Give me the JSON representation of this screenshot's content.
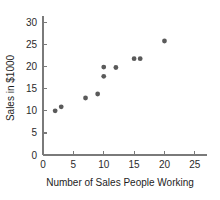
{
  "chart_data": {
    "type": "scatter",
    "title": "",
    "xlabel": "Number of Sales People Working",
    "ylabel": "Sales in $1000",
    "xlim": [
      0,
      27
    ],
    "ylim": [
      0,
      31
    ],
    "xticks": [
      0,
      5,
      10,
      15,
      20,
      25
    ],
    "yticks": [
      0,
      5,
      10,
      15,
      20,
      25,
      30
    ],
    "xtick_labels": [
      "0",
      "5",
      "10",
      "15",
      "20",
      "25"
    ],
    "ytick_labels": [
      "0",
      "5",
      "10",
      "15",
      "20",
      "25",
      "30"
    ],
    "grid": false,
    "legend": null,
    "marker_color": "#5a5a5a",
    "axis_color": "#7a7a7a",
    "points": [
      {
        "x": 2,
        "y": 10.0
      },
      {
        "x": 3,
        "y": 10.9
      },
      {
        "x": 7,
        "y": 12.9
      },
      {
        "x": 9,
        "y": 13.8
      },
      {
        "x": 10,
        "y": 17.8
      },
      {
        "x": 10,
        "y": 19.9
      },
      {
        "x": 12,
        "y": 19.8
      },
      {
        "x": 15,
        "y": 21.8
      },
      {
        "x": 16,
        "y": 21.8
      },
      {
        "x": 20,
        "y": 25.8
      }
    ]
  }
}
